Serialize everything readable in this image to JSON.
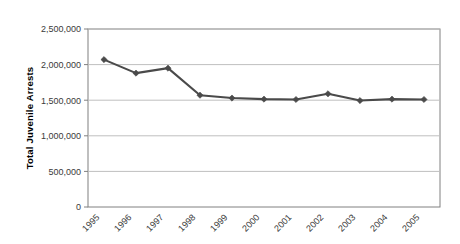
{
  "chart_data": {
    "type": "line",
    "title": "",
    "xlabel": "",
    "ylabel": "Total Juvenile Arrests",
    "categories": [
      "1995",
      "1996",
      "1997",
      "1998",
      "1999",
      "2000",
      "2001",
      "2002",
      "2003",
      "2004",
      "2005"
    ],
    "values": [
      2070000,
      1880000,
      1950000,
      1570000,
      1530000,
      1515000,
      1510000,
      1590000,
      1495000,
      1515000,
      1510000
    ],
    "series": [
      {
        "name": "Total Juvenile Arrests",
        "values": [
          2070000,
          1880000,
          1950000,
          1570000,
          1530000,
          1515000,
          1510000,
          1590000,
          1495000,
          1515000,
          1510000
        ]
      }
    ],
    "ylim": [
      0,
      2500000
    ],
    "ytick_values": [
      0,
      500000,
      1000000,
      1500000,
      2000000,
      2500000
    ],
    "ytick_labels": [
      "0",
      "500,000",
      "1,000,000",
      "1,500,000",
      "2,000,000",
      "2,500,000"
    ],
    "grid": true,
    "grid_axis": "y",
    "legend": "none",
    "marker": "diamond",
    "line_color": "#4a4a4a",
    "marker_color": "#4a4a4a",
    "grid_color": "#bfbfbf",
    "axis_color": "#808080",
    "background_color": "#ffffff",
    "xtick_label_rotation": -45
  }
}
